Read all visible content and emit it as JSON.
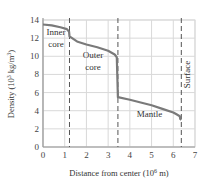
{
  "chart_data": {
    "type": "line",
    "title": "",
    "xlabel": "Distance from center (10^6 m)",
    "xlabel_main": "Distance from center (10",
    "xlabel_sup": "6",
    "xlabel_end": " m)",
    "ylabel_main": "Density (10",
    "ylabel_sup": "3",
    "ylabel_mid": " kg/m",
    "ylabel_sup2": "3",
    "ylabel_end": ")",
    "ylabel": "Density (10^3 kg/m^3)",
    "xlim": [
      0,
      7
    ],
    "ylim": [
      0,
      14
    ],
    "xticks": [
      "0",
      "1",
      "2",
      "3",
      "4",
      "5",
      "6",
      "7"
    ],
    "yticks": [
      "0",
      "2",
      "4",
      "6",
      "8",
      "10",
      "12",
      "14"
    ],
    "grid": true,
    "series": [
      {
        "name": "Earth density profile",
        "x": [
          0,
          0.4,
          0.8,
          1.1,
          1.2,
          1.22,
          1.6,
          2.0,
          2.5,
          3.0,
          3.3,
          3.4,
          3.45,
          4.0,
          4.5,
          5.0,
          5.5,
          6.0,
          6.15,
          6.3,
          6.32,
          6.37
        ],
        "values": [
          13.5,
          13.4,
          13.2,
          13.0,
          12.7,
          12.2,
          11.6,
          11.3,
          11.0,
          10.6,
          10.2,
          9.9,
          5.5,
          5.2,
          4.9,
          4.6,
          4.2,
          3.8,
          3.6,
          3.4,
          3.1,
          3.0
        ]
      }
    ],
    "boundaries": [
      {
        "name": "Inner core / outer core",
        "x": 1.22
      },
      {
        "name": "Outer core / mantle",
        "x": 3.45
      },
      {
        "name": "Surface",
        "x": 6.37
      }
    ],
    "annotations": [
      {
        "text": "Inner",
        "x": 0.6,
        "y": 12.3
      },
      {
        "text": "core",
        "x": 0.6,
        "y": 11.0
      },
      {
        "text": "Outer",
        "x": 2.3,
        "y": 9.8
      },
      {
        "text": "core",
        "x": 2.3,
        "y": 8.5
      },
      {
        "text": "Mantle",
        "x": 4.9,
        "y": 3.3
      },
      {
        "text": "Surface",
        "x": 6.75,
        "y": 8.0,
        "rotation": -90
      }
    ],
    "colors": {
      "curve": "#7a7a7a",
      "grid": "#d9d9d9",
      "dashed": "#555555",
      "axis": "#9a9a9a"
    }
  }
}
